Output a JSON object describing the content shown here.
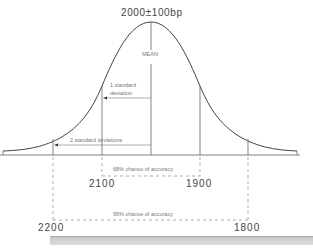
{
  "diagram": {
    "title": "2000±100bp",
    "mean_label": "MEAN",
    "sd1_label_line1": "1 standard",
    "sd1_label_line2": "deviation",
    "sd2_label": "2 standard deviations",
    "range68_label": "68% chance of accuracy",
    "range95_label": "95% chance of accuracy",
    "ticks": {
      "minus1sd": "2100",
      "plus1sd": "1900",
      "minus2sd": "2200",
      "plus2sd": "1800"
    },
    "colors": {
      "line": "#555555",
      "text": "#555555",
      "bar": "#d0d0d0"
    }
  }
}
